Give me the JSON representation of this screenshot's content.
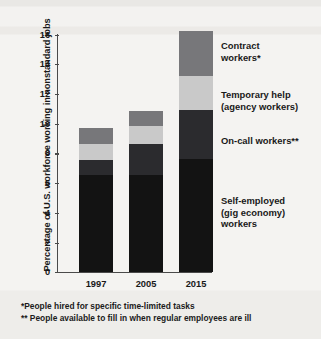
{
  "chart_data": {
    "type": "bar",
    "subtype": "stacked-bar",
    "title": "",
    "xlabel": "",
    "ylabel": "Percentage of U.S. workforce working in nonstandard jobs",
    "categories": [
      "1997",
      "2005",
      "2015"
    ],
    "ylim": [
      0,
      16
    ],
    "yticks": [
      0,
      2,
      4,
      6,
      8,
      10,
      12,
      14,
      16
    ],
    "ytick_labels": [
      "0",
      "2",
      "4",
      "6",
      "8",
      "10",
      "12",
      "14",
      "16"
    ],
    "grid": false,
    "legend_position": "right-inline-annotations",
    "series": [
      {
        "name": "Self-employed (gig economy) workers",
        "color": "#131313",
        "values": [
          6.5,
          6.5,
          7.6
        ]
      },
      {
        "name": "On-call workers**",
        "color": "#2b2b2e",
        "values": [
          1.0,
          2.1,
          3.3
        ]
      },
      {
        "name": "Temporary help (agency workers)",
        "color": "#c9c9c9",
        "values": [
          1.1,
          1.2,
          2.3
        ]
      },
      {
        "name": "Contract workers*",
        "color": "#77777a",
        "values": [
          1.1,
          1.0,
          3.0
        ]
      }
    ],
    "totals": [
      9.7,
      10.8,
      16.2
    ],
    "annotations": [
      "*People hired for specific time-limited tasks",
      "** People available to fill in when regular employees are ill"
    ]
  },
  "axis": {
    "y_title": "Percentage of U.S. workforce working in nonstandard jobs",
    "ticks": [
      "16",
      "14",
      "12",
      "10",
      "8",
      "6",
      "4",
      "2",
      "0"
    ],
    "x_categories": [
      "1997",
      "2005",
      "2015"
    ]
  },
  "legend": {
    "contract": "Contract\nworkers*",
    "temporary": "Temporary help\n(agency workers)",
    "oncall": "On-call workers**",
    "self_employed": "Self-employed\n(gig economy)\nworkers"
  },
  "footnotes": {
    "one": "*People hired for specific time-limited tasks",
    "two": "** People available to fill in when regular employees are ill"
  },
  "colors": {
    "contract": "#77777a",
    "temporary": "#c9c9c9",
    "oncall": "#2b2b2e",
    "self_employed": "#131313",
    "background": "#f3f2f0",
    "axis": "#4a4a4a",
    "text": "#191919"
  }
}
